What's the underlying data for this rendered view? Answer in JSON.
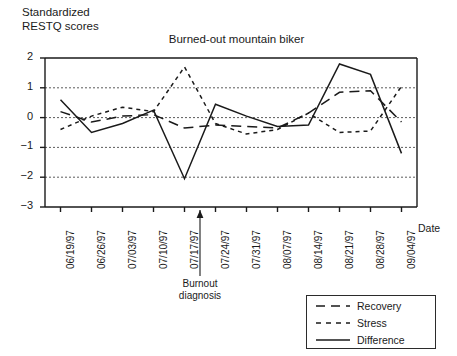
{
  "figure": {
    "y_axis_caption": "Standardized\nRESTQ scores",
    "date_axis_label": "Date",
    "annotation": "Burnout\ndiagnosis"
  },
  "chart_data": {
    "type": "line",
    "title": "Burned-out mountain biker",
    "xlabel": "Date",
    "ylabel": "Standardized RESTQ scores",
    "ylim": [
      -3,
      2
    ],
    "yticks": [
      2,
      1,
      0,
      -1,
      -2,
      -3
    ],
    "grid": "horizontal-dotted",
    "legend_position": "bottom-right-outside",
    "categories": [
      "06/19/97",
      "06/26/97",
      "07/03/97",
      "07/10/97",
      "07/17/97",
      "07/24/97",
      "07/31/97",
      "08/07/97",
      "08/14/97",
      "08/21/97",
      "08/28/97",
      "09/04/97"
    ],
    "series": [
      {
        "name": "Recovery",
        "style": "long-dash",
        "color": "#1a1a1a",
        "values": [
          0.2,
          -0.15,
          0.05,
          0.1,
          -0.35,
          -0.25,
          -0.3,
          -0.35,
          0.15,
          0.85,
          0.9,
          -0.15
        ]
      },
      {
        "name": "Stress",
        "style": "short-dash",
        "color": "#1a1a1a",
        "values": [
          -0.4,
          0.05,
          0.35,
          0.2,
          1.7,
          -0.2,
          -0.55,
          -0.4,
          0.15,
          -0.5,
          -0.45,
          1.05
        ]
      },
      {
        "name": "Difference",
        "style": "solid",
        "color": "#1a1a1a",
        "values": [
          0.6,
          -0.5,
          -0.2,
          0.25,
          -2.05,
          0.45,
          0.05,
          -0.3,
          -0.25,
          1.8,
          1.45,
          -1.2
        ]
      }
    ],
    "annotations": [
      {
        "text": "Burnout diagnosis",
        "points_to_category": "07/17/97"
      }
    ]
  }
}
